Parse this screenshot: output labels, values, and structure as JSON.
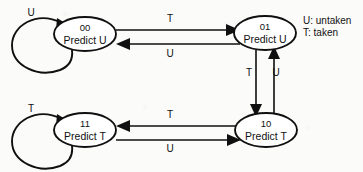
{
  "diagram": {
    "type": "finite-state-machine",
    "nodes": [
      {
        "id": "s00",
        "code": "00",
        "action": "Predict U",
        "cx": 85,
        "cy": 34,
        "rx": 31,
        "ry": 17
      },
      {
        "id": "s01",
        "code": "01",
        "action": "Predict U",
        "cx": 265,
        "cy": 33,
        "rx": 31,
        "ry": 17
      },
      {
        "id": "s11",
        "code": "11",
        "action": "Predict T",
        "cx": 85,
        "cy": 130,
        "rx": 31,
        "ry": 17
      },
      {
        "id": "s10",
        "code": "10",
        "action": "Predict T",
        "cx": 266,
        "cy": 130,
        "rx": 31,
        "ry": 17
      }
    ],
    "self_loops": [
      {
        "id": "loop-00",
        "node": "s00",
        "label": "U",
        "label_x": 31,
        "label_y": 16
      },
      {
        "id": "loop-11",
        "node": "s11",
        "label": "T",
        "label_x": 31,
        "label_y": 112
      }
    ],
    "edges": [
      {
        "id": "e-00-01-top",
        "from": "00",
        "to": "01",
        "label": "T",
        "label_x": 170,
        "label_y": 22,
        "direction": "right"
      },
      {
        "id": "e-01-00-top",
        "from": "01",
        "to": "00",
        "label": "U",
        "label_x": 170,
        "label_y": 57,
        "direction": "left"
      },
      {
        "id": "e-01-10-down",
        "from": "01",
        "to": "10",
        "label": "T",
        "label_x": 249,
        "label_y": 76,
        "direction": "down"
      },
      {
        "id": "e-10-01-up",
        "from": "10",
        "to": "01",
        "label": "U",
        "label_x": 276,
        "label_y": 76,
        "direction": "up"
      },
      {
        "id": "e-10-11-bottom",
        "from": "10",
        "to": "11",
        "label": "T",
        "label_x": 170,
        "label_y": 118,
        "direction": "left"
      },
      {
        "id": "e-11-10-bottom",
        "from": "11",
        "to": "10",
        "label": "U",
        "label_x": 170,
        "label_y": 152,
        "direction": "right"
      }
    ],
    "legend": {
      "lines": [
        "U: untaken",
        "T: taken"
      ],
      "x": 303,
      "y": 24
    },
    "colors": {
      "stroke": "#101010",
      "node_fill": "#ffffff",
      "background": "#fbfbf9",
      "text": "#111111"
    }
  }
}
